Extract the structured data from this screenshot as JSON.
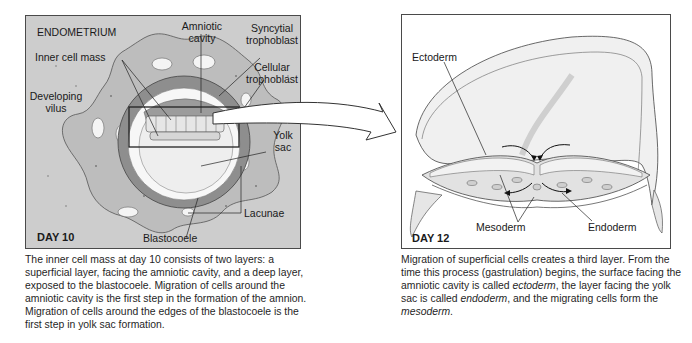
{
  "left_panel": {
    "title": "ENDOMETRIUM",
    "day_label": "DAY 10",
    "labels": {
      "amniotic_cavity_1": "Amniotic",
      "amniotic_cavity_2": "cavity",
      "syncytial_1": "Syncytial",
      "syncytial_2": "trophoblast",
      "inner_cell_mass": "Inner cell mass",
      "cellular_1": "Cellular",
      "cellular_2": "trophoblast",
      "developing_1": "Developing",
      "developing_2": "vilus",
      "yolk_1": "Yolk",
      "yolk_2": "sac",
      "lacunae": "Lacunae",
      "blastocoele": "Blastocoele"
    },
    "colors": {
      "endometrium": "#cdcdcd",
      "syncytial": "#bdbdbd",
      "cellular": "#8e8e8e",
      "cavity": "#f4f4f4"
    }
  },
  "right_panel": {
    "day_label": "DAY 12",
    "labels": {
      "ectoderm": "Ectoderm",
      "mesoderm": "Mesoderm",
      "endoderm": "Endoderm"
    }
  },
  "captions": {
    "left": "The inner cell mass at day 10 consists of two layers: a superficial layer, facing the amniotic cavity, and a deep layer, exposed to the blastocoele. Migration of cells around the amniotic cavity is the first step in the formation of the amnion. Migration of cells around the edges of the blastocoele is the first step in yolk sac formation.",
    "right_part1": "Migration of superficial cells creates a third layer. From the time this process (gastrulation) begins, the surface facing the amniotic cavity is called ",
    "right_ectoderm": "ectoderm",
    "right_part2": ", the layer facing the yolk sac is called ",
    "right_endoderm": "endoderm",
    "right_part3": ", and the migrating cells form the ",
    "right_mesoderm": "mesoderm",
    "right_part4": "."
  }
}
